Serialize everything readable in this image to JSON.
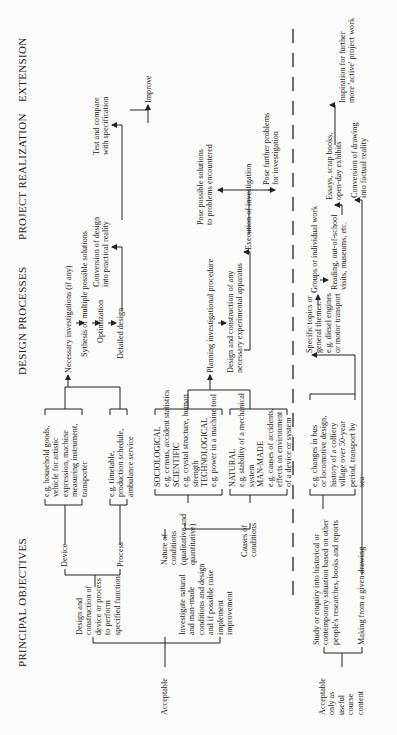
{
  "headers": {
    "principal_objectives": "PRINCIPAL OBJECTIVES",
    "design_processes": "DESIGN PROCESSES",
    "project_realization": "PROJECT REALIZATION",
    "extension": "EXTENSION"
  },
  "acceptable": {
    "label": "Acceptable",
    "design_construction": "Design and\nconstruction of\ndevice or process\nto perform\nspecified function",
    "device": "Device",
    "process": "Process",
    "device_examples": "e.g. household goods,\nvehicle for artistic\nexpression, machine\nmeasuring instrument,\ntransporter",
    "process_examples": "e.g. timetable,\nproduction schedule,\nambulance service",
    "investigate": "Investigate natural\nand man-made\nconditions and design\nand if possible raise\nimplement\nimprovement",
    "nature_of_conditions": "Nature of\nconditions\n(qualitative and\nquantitative)",
    "causes_of_conditions": "Causes of\nconditions",
    "nature_examples": "SOCIOLOGICAL\ne.g. census, accident statistics\nSCIENTIFIC\ne.g. crystal structure, human\nstrength\nTECHNOLOGICAL\ne.g. power in a machine tool",
    "causes_examples": "NATURAL\ne.g. stability of a mechanical\nsystem\nMAN-MADE\ne.g. causes of accidents,\neffects on environment\nof a device or system"
  },
  "design_processes": {
    "necessary_investigations": "Necessary investigations (if any)",
    "synthesis": "Sythesis of multiple possible solutions",
    "optimization": "Optimization",
    "detailed_design": "Detailed design",
    "planning": "Planning investigational procedure",
    "apparatus": "Design and construction of any\nnecessary experimental apparatus"
  },
  "project_realization": {
    "conversion_design": "Conversion of design\ninto practical reality",
    "execution": "Execution of investigation"
  },
  "extension": {
    "test_compare": "Test and compare\nwith specification",
    "improve": "Improve",
    "pose_solutions": "Pose possible solutions\nto problems encountered",
    "pose_problems": "Pose further problems\nfor investigation"
  },
  "useful_content": {
    "label": "Acceptable\nonly as\nuseful\ncourse\ncontent",
    "study": "Study or enquiry into historical or\ncontemporary situation based on other\npeople's researches, books and reports",
    "study_examples": "e.g. changes in bus\nor locomotive design,\nhistory of a colliery\nvillage over 50-year\nperiod, transport by\nsea",
    "making_drawing": "Making from a given drawing",
    "specific_topics": "Specific topics or\ngeneral themes.\ne.g. diesel engines\nor motor transport",
    "groups": "Groups or individual work",
    "reading": "Reading, out-of-school\nvisits, museums, etc.",
    "essays": "Essays, scrap books,\nopen-day exhibits",
    "conversion_drawing": "Conversion of drawing\ninto factual reality",
    "inspiration": "Inspiration for further\nmore 'active' project work"
  }
}
